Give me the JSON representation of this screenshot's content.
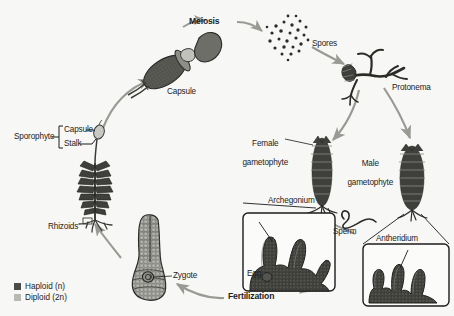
{
  "diagram": {
    "background_color": "#f7f7f5",
    "arrow_color": "#9a9a95",
    "structure_dark": "#3f3f3c",
    "structure_mid": "#6e6e69",
    "structure_light": "#b9b9b4"
  },
  "labels": {
    "meiosis": "Meiosis",
    "spores": "Spores",
    "protonema": "Protonema",
    "capsule_structure": "Capsule",
    "sporophyte": "Sporophyte",
    "bracket_capsule": "Capsule",
    "bracket_stalk": "Stalk",
    "rhizoids": "Rhizoids",
    "zygote": "Zygote",
    "fertilization": "Fertilization",
    "female_gametophyte_line1": "Female",
    "female_gametophyte_line2": "gametophyte",
    "male_gametophyte_line1": "Male",
    "male_gametophyte_line2": "gametophyte",
    "archegonium": "Archegonium",
    "egg": "Egg",
    "sperm": "Sperm",
    "antheridium": "Antheridium"
  },
  "legend": {
    "items": [
      {
        "label": "Haploid (n)",
        "color": "#4a4a46",
        "swatch_class": "sw-hap"
      },
      {
        "label": "Diploid (2n)",
        "color": "#b9b9b4",
        "swatch_class": "sw-dip"
      }
    ],
    "haploid_label": "Haploid (n)",
    "diploid_label": "Diploid (2n)"
  },
  "icons": {
    "meiosis_arrow": "curved-arrow-icon",
    "spore_cloud": "spore-dots-icon",
    "sperm_squiggle": "sperm-flagellum-icon",
    "bracket": "brace-bracket-icon"
  }
}
